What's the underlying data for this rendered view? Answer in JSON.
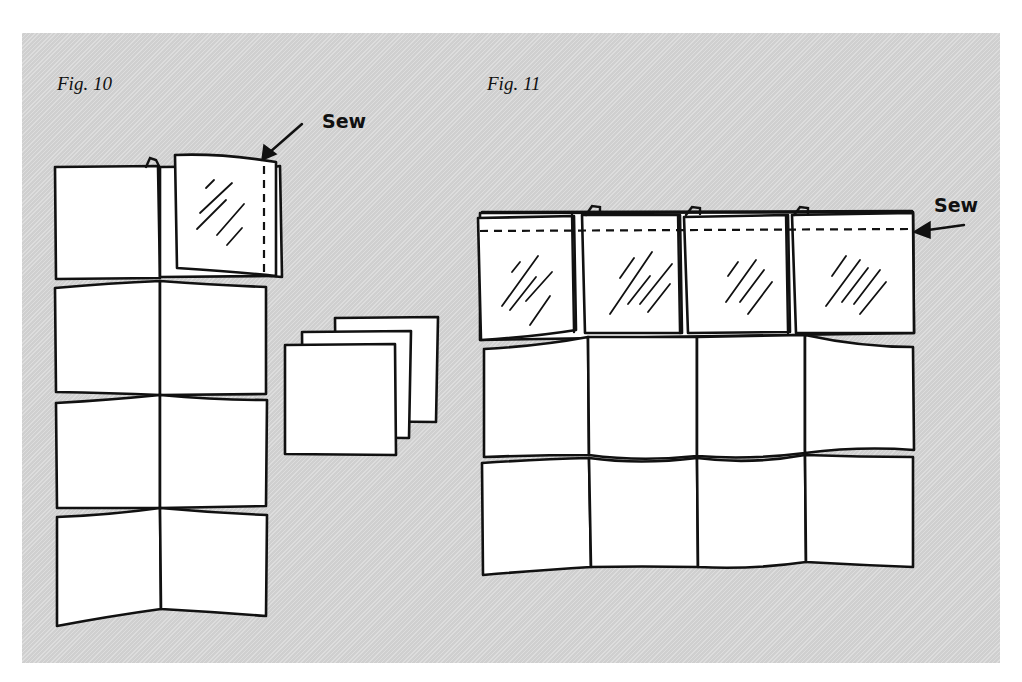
{
  "figures": [
    {
      "label": "Fig. 10",
      "annotation": "Sew",
      "description": "Two-column strip of 4 rows of squares; top-right square folded over with vertical seam line",
      "rows": 4,
      "columns": 2
    },
    {
      "label": "Fig. 11",
      "annotation": "Sew",
      "description": "Four-column, three-row grid; top row squares folded down with horizontal seam line",
      "rows": 3,
      "columns": 4
    }
  ],
  "stack": {
    "label": "3",
    "count": 3
  },
  "colors": {
    "panel_background": "#d6d6d6",
    "square_fill": "#ffffff",
    "ink": "#111111"
  }
}
